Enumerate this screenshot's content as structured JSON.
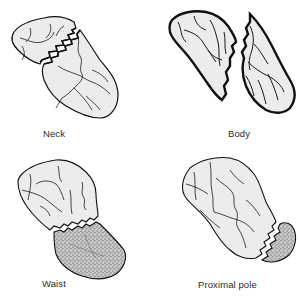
{
  "figure": {
    "colors": {
      "bone_fill": "#ececec",
      "outline": "#111111",
      "vessel": "#1a1a1a",
      "avascular_stipple": "#9a9a9a",
      "label_text": "#2a2a2a",
      "background": "#ffffff"
    },
    "panels": [
      {
        "id": "neck",
        "label": "Neck",
        "position": "top-left",
        "avascular_fragment": false
      },
      {
        "id": "body",
        "label": "Body",
        "position": "top-right",
        "avascular_fragment": false
      },
      {
        "id": "waist",
        "label": "Waist",
        "position": "bottom-left",
        "avascular_fragment": true
      },
      {
        "id": "proximal-pole",
        "label": "Proximal pole",
        "position": "bottom-right",
        "avascular_fragment": true
      }
    ]
  }
}
